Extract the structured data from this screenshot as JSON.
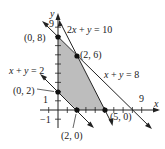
{
  "figure": {
    "type": "linear-programming-feasible-region",
    "axes": {
      "x_label": "x",
      "y_label": "y",
      "x_tick_label": "9",
      "y_tick_label": "9",
      "neg_x_tick_label": "−1",
      "neg_y_tick_label": "−1",
      "pos_y_tick_label": "1"
    },
    "lines": [
      {
        "equation": "2x + y = 10",
        "label_parts": [
          "2",
          "x",
          " + ",
          "y",
          " = 10"
        ]
      },
      {
        "equation": "x + y = 8",
        "label_parts": [
          "x",
          " + ",
          "y",
          " = 8"
        ]
      },
      {
        "equation": "x + y = 2",
        "label_parts": [
          "x",
          " + ",
          "y",
          " = 2"
        ]
      }
    ],
    "vertices": [
      {
        "label": "(0, 8)",
        "x": 0,
        "y": 8
      },
      {
        "label": "(2, 6)",
        "x": 2,
        "y": 6
      },
      {
        "label": "(0, 2)",
        "x": 0,
        "y": 2
      },
      {
        "label": "(2, 0)",
        "x": 2,
        "y": 0
      },
      {
        "label": "(5, 0)",
        "x": 5,
        "y": 0
      }
    ],
    "region_fill": "#bdbdbd",
    "line_color": "#222222"
  }
}
